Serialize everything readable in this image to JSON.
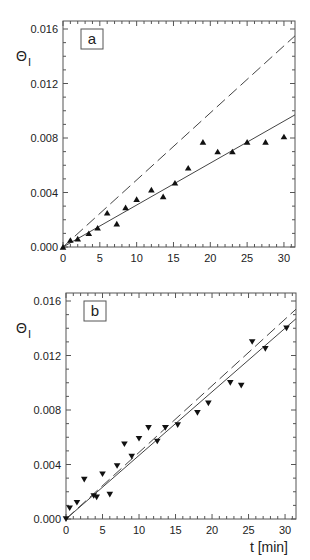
{
  "chart_data": [
    {
      "type": "scatter",
      "panel_label": "a",
      "title": "",
      "xlabel": "",
      "ylabel": "Θ_I",
      "ylabel_main": "Θ",
      "ylabel_sub": "I",
      "xlim": [
        0,
        31.5
      ],
      "ylim": [
        0,
        0.0165
      ],
      "x_ticks": [
        0,
        5,
        10,
        15,
        20,
        25,
        30
      ],
      "x_tick_labels": [
        "0",
        "5",
        "10",
        "15",
        "20",
        "25",
        "30"
      ],
      "y_ticks": [
        0,
        0.004,
        0.008,
        0.012,
        0.016
      ],
      "y_tick_labels": [
        "0.000",
        "0.004",
        "0.008",
        "0.012",
        "0.016"
      ],
      "grid": false,
      "legend": null,
      "series": [
        {
          "name": "measured",
          "kind": "markers",
          "marker": "triangle-up",
          "x": [
            0,
            1,
            2,
            3.5,
            4.7,
            6,
            7.3,
            8.5,
            10,
            12,
            13.6,
            15.2,
            17,
            19,
            21,
            23,
            25,
            27.5,
            30
          ],
          "y": [
            0,
            0.0005,
            0.0006,
            0.001,
            0.0014,
            0.0025,
            0.0017,
            0.0029,
            0.0035,
            0.0042,
            0.0037,
            0.0047,
            0.0058,
            0.0077,
            0.007,
            0.007,
            0.0077,
            0.0077,
            0.0081
          ]
        },
        {
          "name": "fit (solid)",
          "kind": "line",
          "style": "solid",
          "x": [
            0,
            31.5
          ],
          "y": [
            0,
            0.0097
          ]
        },
        {
          "name": "model (dashed)",
          "kind": "line",
          "style": "dashed",
          "x": [
            0,
            31.5
          ],
          "y": [
            0,
            0.0155
          ]
        }
      ]
    },
    {
      "type": "scatter",
      "panel_label": "b",
      "title": "",
      "xlabel": "t [min]",
      "ylabel": "Θ_I",
      "ylabel_main": "Θ",
      "ylabel_sub": "I",
      "xlim": [
        0,
        31.5
      ],
      "ylim": [
        0,
        0.0165
      ],
      "x_ticks": [
        0,
        5,
        10,
        15,
        20,
        25,
        30
      ],
      "x_tick_labels": [
        "0",
        "5",
        "10",
        "15",
        "20",
        "25",
        "30"
      ],
      "y_ticks": [
        0,
        0.004,
        0.008,
        0.012,
        0.016
      ],
      "y_tick_labels": [
        "0.000",
        "0.004",
        "0.008",
        "0.012",
        "0.016"
      ],
      "grid": false,
      "legend": null,
      "series": [
        {
          "name": "measured",
          "kind": "markers",
          "marker": "triangle-down",
          "x": [
            0,
            0.5,
            1.5,
            2.5,
            3.8,
            4.2,
            5,
            6,
            7,
            8,
            9,
            10,
            11.3,
            12.5,
            13.6,
            15.3,
            18,
            19.5,
            22.5,
            24,
            25.5,
            27.3,
            30.2
          ],
          "y": [
            0,
            0.0008,
            0.0012,
            0.0029,
            0.0017,
            0.0016,
            0.0033,
            0.0018,
            0.0039,
            0.0055,
            0.0046,
            0.0059,
            0.0067,
            0.0057,
            0.0067,
            0.0069,
            0.0078,
            0.0085,
            0.01,
            0.0098,
            0.013,
            0.0125,
            0.014
          ]
        },
        {
          "name": "fit (solid)",
          "kind": "line",
          "style": "solid",
          "x": [
            0,
            31.5
          ],
          "y": [
            0,
            0.0147
          ]
        },
        {
          "name": "model (dashed)",
          "kind": "line",
          "style": "dashed",
          "x": [
            0,
            31.5
          ],
          "y": [
            0,
            0.0154
          ]
        }
      ]
    }
  ],
  "colors": {
    "axis": "#555555",
    "markers": "#111111",
    "solid_line": "#444444",
    "dashed_line": "#444444",
    "background": "#ffffff"
  }
}
